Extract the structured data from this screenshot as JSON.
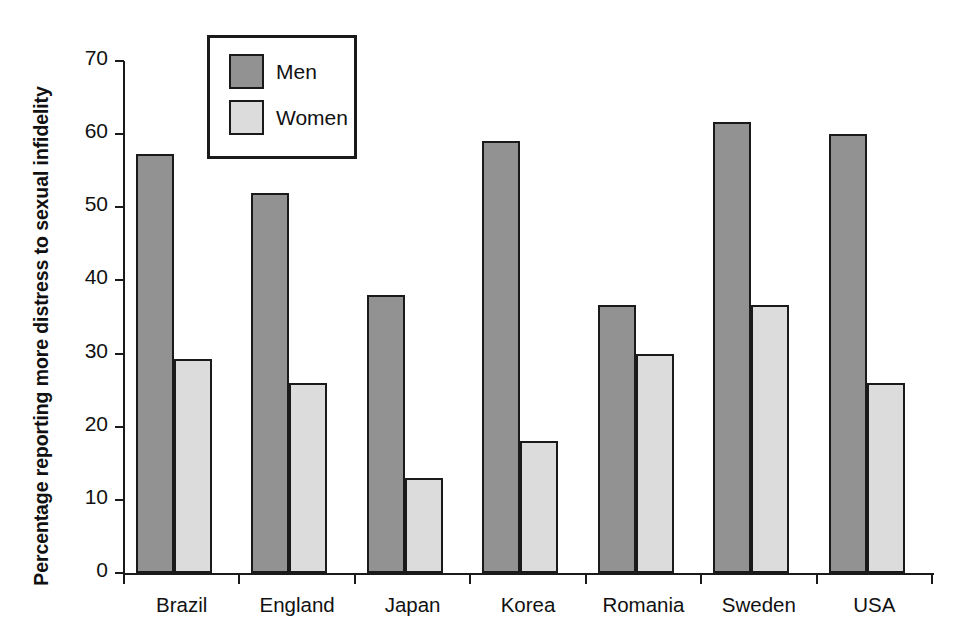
{
  "chart_data": {
    "type": "bar",
    "title": "",
    "subtitle": "",
    "xlabel": "",
    "ylabel": "Percentage reporting more distress to sexual infidelity",
    "categories": [
      "Brazil",
      "England",
      "Japan",
      "Korea",
      "Romania",
      "Sweden",
      "USA"
    ],
    "series": [
      {
        "name": "Men",
        "values": [
          57.3,
          52.0,
          38.0,
          59.0,
          36.6,
          61.7,
          60.0
        ],
        "color": "#929292"
      },
      {
        "name": "Women",
        "values": [
          29.2,
          26.0,
          13.0,
          18.0,
          30.0,
          36.6,
          26.0
        ],
        "color": "#dcdcdc"
      }
    ],
    "ylim": [
      0,
      70
    ],
    "yticks": [
      0,
      10,
      20,
      30,
      40,
      50,
      60,
      70
    ],
    "ytick_labels": [
      "0",
      "10",
      "20",
      "30",
      "40",
      "50",
      "60",
      "70"
    ],
    "grid": false,
    "legend": {
      "position": "upper-left-inset",
      "entries": [
        "Men",
        "Women"
      ]
    },
    "axis_color": "#1a1a1a",
    "background": "#ffffff"
  },
  "legend": {
    "items": [
      {
        "label": "Men"
      },
      {
        "label": "Women"
      }
    ]
  },
  "axis": {
    "y_title": "Percentage reporting more distress to sexual infidelity"
  }
}
